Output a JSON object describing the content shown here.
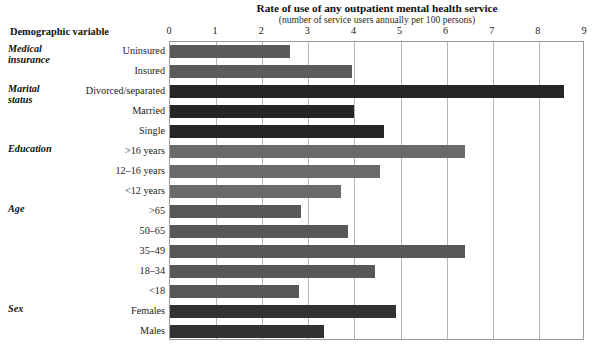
{
  "chart_data": {
    "type": "bar",
    "orientation": "horizontal",
    "title": "Rate of use of any outpatient mental health service",
    "subtitle": "(number of service users annually per 100 persons)",
    "category_axis_title": "Demographic variable",
    "xlabel": "",
    "ylabel": "",
    "xlim": [
      0,
      9
    ],
    "xticks": [
      "0",
      "1",
      "2",
      "3",
      "4",
      "5",
      "6",
      "7",
      "8",
      "9"
    ],
    "grid": true,
    "legend": "none",
    "groups": [
      {
        "name": "Medical insurance",
        "name_lines": [
          "Medical",
          "insurance"
        ],
        "color": "#5b5b5b",
        "items": [
          {
            "label": "Uninsured",
            "value": 2.6
          },
          {
            "label": "Insured",
            "value": 3.95
          }
        ]
      },
      {
        "name": "Marital status",
        "name_lines": [
          "Marital",
          "status"
        ],
        "color": "#262626",
        "items": [
          {
            "label": "Divorced/separated",
            "value": 8.55
          },
          {
            "label": "Married",
            "value": 4.0
          },
          {
            "label": "Single",
            "value": 4.65
          }
        ]
      },
      {
        "name": "Education",
        "name_lines": [
          "Education"
        ],
        "color": "#6a6a6a",
        "items": [
          {
            "label": ">16 years",
            "value": 6.4
          },
          {
            "label": "12–16 years",
            "value": 4.55
          },
          {
            "label": "<12 years",
            "value": 3.7
          }
        ]
      },
      {
        "name": "Age",
        "name_lines": [
          "Age"
        ],
        "color": "#585858",
        "items": [
          {
            "label": ">65",
            "value": 2.85
          },
          {
            "label": "50–65",
            "value": 3.85
          },
          {
            "label": "35–49",
            "value": 6.4
          },
          {
            "label": "18–34",
            "value": 4.45
          },
          {
            "label": "<18",
            "value": 2.8
          }
        ]
      },
      {
        "name": "Sex",
        "name_lines": [
          "Sex"
        ],
        "color": "#323232",
        "items": [
          {
            "label": "Females",
            "value": 4.9
          },
          {
            "label": "Males",
            "value": 3.35
          }
        ]
      }
    ]
  },
  "style": {
    "plot_border_color": "#9a9a9a",
    "gridline_color": "#b4b4b4",
    "background": "#ffffff",
    "text_color": "#222222"
  }
}
